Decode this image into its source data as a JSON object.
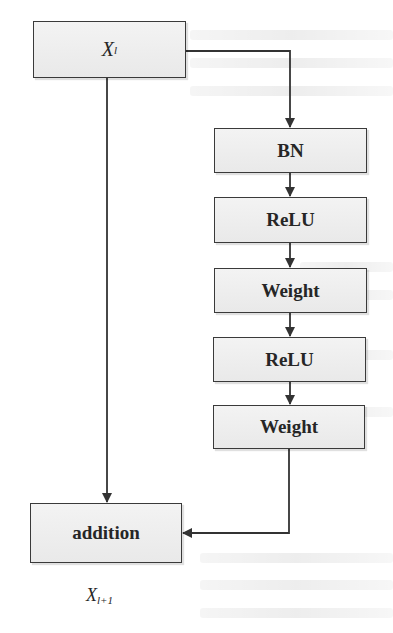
{
  "diagram": {
    "type": "residual-block-flowchart",
    "input": {
      "label_main": "X",
      "label_sub": "l"
    },
    "output": {
      "label_main": "X",
      "label_sub": "l+1"
    },
    "nodes": [
      {
        "id": "bn",
        "label": "BN"
      },
      {
        "id": "relu1",
        "label": "ReLU"
      },
      {
        "id": "weight1",
        "label": "Weight"
      },
      {
        "id": "relu2",
        "label": "ReLU"
      },
      {
        "id": "weight2",
        "label": "Weight"
      },
      {
        "id": "addition",
        "label": "addition"
      }
    ],
    "edges": [
      {
        "from": "input",
        "to": "bn"
      },
      {
        "from": "bn",
        "to": "relu1"
      },
      {
        "from": "relu1",
        "to": "weight1"
      },
      {
        "from": "weight1",
        "to": "relu2"
      },
      {
        "from": "relu2",
        "to": "weight2"
      },
      {
        "from": "weight2",
        "to": "addition"
      },
      {
        "from": "input",
        "to": "addition",
        "kind": "skip-connection"
      }
    ],
    "colors": {
      "line": "#333333",
      "box_fill": "#eeeeee",
      "background": "#ffffff",
      "text": "#262626"
    }
  }
}
